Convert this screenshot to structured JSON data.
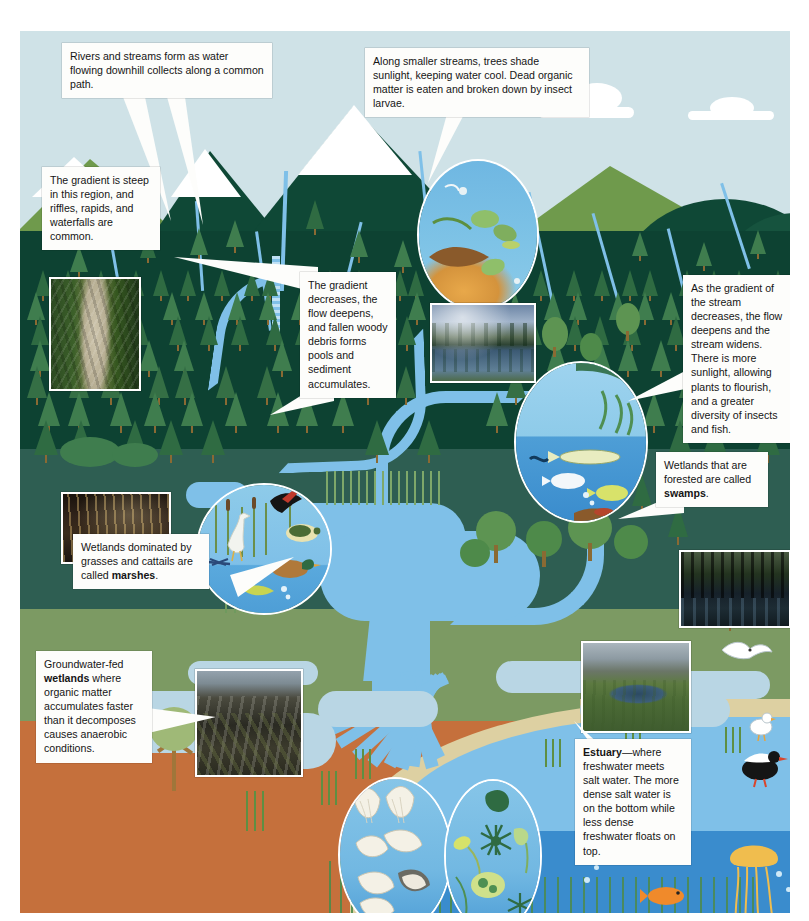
{
  "figure": {
    "background_color": "#cfe2e7"
  },
  "callouts": [
    {
      "id": "headwaters",
      "name": "callout-headwaters",
      "text": "Rivers and streams form as water flowing downhill collects along a common path."
    },
    {
      "id": "shading",
      "name": "callout-stream-shading",
      "text": "Along smaller streams, trees shade sunlight, keeping water cool. Dead organic matter is eaten and broken down by insect larvae."
    },
    {
      "id": "gradient-steep",
      "name": "callout-steep-gradient",
      "text": "The gradient is steep in this region, and riffles, rapids, and waterfalls are common."
    },
    {
      "id": "gradient-decreases",
      "name": "callout-gradient-decreases",
      "text": "The gradient decreases, the flow deepens, and fallen woody debris forms pools and sediment accumulates."
    },
    {
      "id": "stream-widens",
      "name": "callout-stream-widens",
      "text": "As the gradient of the stream decreases, the flow deepens and the stream widens. There is more sunlight, allowing plants to flourish, and a greater diversity of insects and fish."
    },
    {
      "id": "swamps",
      "name": "callout-swamps",
      "text_plain": "Wetlands that are forested are called ",
      "text_bold": "swamps",
      "text_tail": "."
    },
    {
      "id": "marshes",
      "name": "callout-marshes",
      "text_plain": "Wetlands dominated by grasses and cattails are called ",
      "text_bold": "marshes",
      "text_tail": "."
    },
    {
      "id": "groundwater-wetlands",
      "name": "callout-groundwater-wetlands",
      "text_lead": "Groundwater-fed ",
      "text_bold": "wetlands",
      "text_rest": " where organic matter accumulates faster than it decomposes causes anaerobic conditions."
    },
    {
      "id": "estuary",
      "name": "callout-estuary",
      "text_bold": "Estuary",
      "text_rest": "—where freshwater meets salt water. The more dense salt water is on the bottom while less dense freshwater floats on top."
    }
  ],
  "photos": [
    {
      "id": "waterfall",
      "name": "photo-waterfall-rapids",
      "caption": "waterfall in steep forested gorge"
    },
    {
      "id": "slow-river",
      "name": "photo-slow-forest-river",
      "caption": "slow river reflecting conifer forest and clouds"
    },
    {
      "id": "swamp",
      "name": "photo-forested-swamp",
      "caption": "dark forested swamp with cypress trees"
    },
    {
      "id": "marsh-dark",
      "name": "photo-cattail-marsh",
      "caption": "cattail marsh at dusk"
    },
    {
      "id": "bog",
      "name": "photo-peat-bog",
      "caption": "groundwater-fed peat bog"
    },
    {
      "id": "saltmarsh",
      "name": "photo-salt-marsh-estuary",
      "caption": "tidal salt marsh creek with mountains"
    }
  ],
  "magnifiers": [
    {
      "id": "leaf-litter",
      "name": "magnifier-leaf-litter-insects",
      "caption": "insect larvae and leaf litter in cold shaded stream"
    },
    {
      "id": "stream-fish",
      "name": "magnifier-stream-plants-fish",
      "caption": "aquatic plants, pike and sunfish in widened stream"
    },
    {
      "id": "marsh-life",
      "name": "magnifier-marsh-wildlife",
      "caption": "heron, blackbird, turtle, duck and cattails in marsh"
    },
    {
      "id": "shellfish",
      "name": "magnifier-shellfish",
      "caption": "clams, oysters and mussels of the estuary bed"
    },
    {
      "id": "plankton",
      "name": "magnifier-plankton",
      "caption": "phytoplankton and zooplankton of the estuary"
    }
  ],
  "zones": [
    {
      "id": "sky",
      "name": "zone-sky",
      "color": "#cfe2e7"
    },
    {
      "id": "mountains",
      "name": "zone-mountains",
      "color": "#0d4232"
    },
    {
      "id": "upland-forest",
      "name": "zone-upland-forest",
      "color": "#0e4433"
    },
    {
      "id": "wetland",
      "name": "zone-wetland",
      "color": "#2e5e52"
    },
    {
      "id": "coastal-plain",
      "name": "zone-coastal-plain",
      "color": "#7c9a63"
    },
    {
      "id": "soil",
      "name": "zone-soil",
      "color": "#c5703c"
    },
    {
      "id": "estuary-water",
      "name": "zone-estuary-water",
      "color": "#3a8ccd"
    }
  ],
  "wildlife": [
    {
      "name": "gull-flying",
      "label": "flying gull"
    },
    {
      "name": "gull-standing",
      "label": "standing gull"
    },
    {
      "name": "oystercatcher",
      "label": "black and white shorebird"
    },
    {
      "name": "jellyfish",
      "label": "jellyfish"
    },
    {
      "name": "orange-fish",
      "label": "orange fish"
    },
    {
      "name": "crab",
      "label": "crab"
    },
    {
      "name": "heron",
      "label": "heron"
    },
    {
      "name": "blackbird",
      "label": "red-winged blackbird"
    },
    {
      "name": "mallard-duck",
      "label": "mallard duck"
    },
    {
      "name": "turtle",
      "label": "turtle"
    },
    {
      "name": "pike-fish",
      "label": "pike"
    },
    {
      "name": "trout-fish",
      "label": "trout"
    }
  ]
}
